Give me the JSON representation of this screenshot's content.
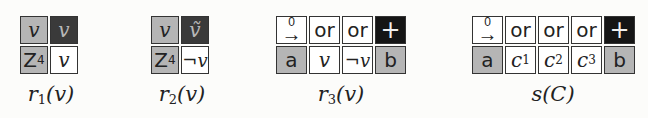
{
  "gadgets": [
    {
      "name": "r1",
      "label_func": "r",
      "label_sub": "1",
      "label_arg": "(v)",
      "cells": [
        {
          "text": "v",
          "style": "gray"
        },
        {
          "text": "v",
          "style": "dark"
        },
        {
          "text": "Z",
          "sub": "4",
          "style": "gray"
        },
        {
          "text": "v",
          "style": "white"
        }
      ]
    },
    {
      "name": "r2",
      "label_func": "r",
      "label_sub": "2",
      "label_arg": "(v)",
      "cells": [
        {
          "text": "v",
          "style": "gray"
        },
        {
          "text": "ṽ",
          "style": "dark"
        },
        {
          "text": "Z",
          "sub": "4",
          "style": "gray"
        },
        {
          "text": "¬v",
          "style": "white"
        }
      ]
    },
    {
      "name": "r3",
      "label_func": "r",
      "label_sub": "3",
      "label_arg": "(v)",
      "cells": [
        {
          "text": "→",
          "over": "0",
          "style": "white"
        },
        {
          "text": "or",
          "style": "white"
        },
        {
          "text": "or",
          "style": "white"
        },
        {
          "text": "+",
          "style": "black"
        },
        {
          "text": "a",
          "style": "gray"
        },
        {
          "text": "v",
          "style": "white"
        },
        {
          "text": "¬v",
          "style": "white"
        },
        {
          "text": "b",
          "style": "gray"
        }
      ]
    },
    {
      "name": "s",
      "label_func": "s",
      "label_sub": "",
      "label_arg": "(C)",
      "cells": [
        {
          "text": "→",
          "over": "0",
          "style": "white"
        },
        {
          "text": "or",
          "style": "white"
        },
        {
          "text": "or",
          "style": "white"
        },
        {
          "text": "or",
          "style": "white"
        },
        {
          "text": "+",
          "style": "black"
        },
        {
          "text": "a",
          "style": "gray"
        },
        {
          "text": "c",
          "sub": "1",
          "style": "white"
        },
        {
          "text": "c",
          "sub": "2",
          "style": "white"
        },
        {
          "text": "c",
          "sub": "3",
          "style": "white"
        },
        {
          "text": "b",
          "style": "gray"
        }
      ]
    }
  ],
  "colors": {
    "gray": "#b5b5b5",
    "dark": "#3a3a3a",
    "black": "#151515",
    "white": "#ffffff",
    "border": "#333333"
  }
}
